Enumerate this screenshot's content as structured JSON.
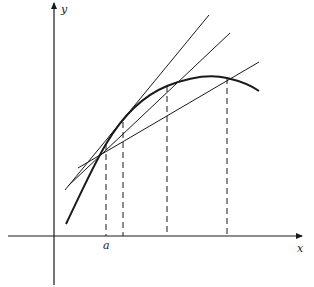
{
  "figure": {
    "type": "secant-lines-approaching-tangent",
    "colors": {
      "ink": "#1a1a1a",
      "background": "#ffffff"
    },
    "axes": {
      "x_label": "x",
      "y_label": "y",
      "origin_px": [
        54,
        236
      ],
      "x_axis": {
        "from": [
          8,
          236
        ],
        "to": [
          302,
          236
        ]
      },
      "y_axis": {
        "from": [
          54,
          285
        ],
        "to": [
          54,
          3
        ]
      }
    },
    "point_label": "a",
    "base_point_px": [
      106,
      144
    ],
    "curve_path": "M 66 224 C 80 195, 92 168, 106 144 C 125 112, 145 95, 167 86 C 190 77, 210 74, 227 78 C 240 81, 252 86, 259 91",
    "dashed_verticals_x": [
      106,
      123,
      167,
      227
    ],
    "dashed_vertical_tops_y": [
      144,
      122,
      86,
      78
    ],
    "lines": [
      {
        "name": "tangent-like-secant",
        "from": [
          65,
          190
        ],
        "to": [
          209,
          15
        ]
      },
      {
        "name": "secant-middle",
        "from": [
          68,
          186
        ],
        "to": [
          230,
          33
        ]
      },
      {
        "name": "secant-far",
        "from": [
          78,
          168
        ],
        "to": [
          259,
          62
        ]
      }
    ]
  }
}
